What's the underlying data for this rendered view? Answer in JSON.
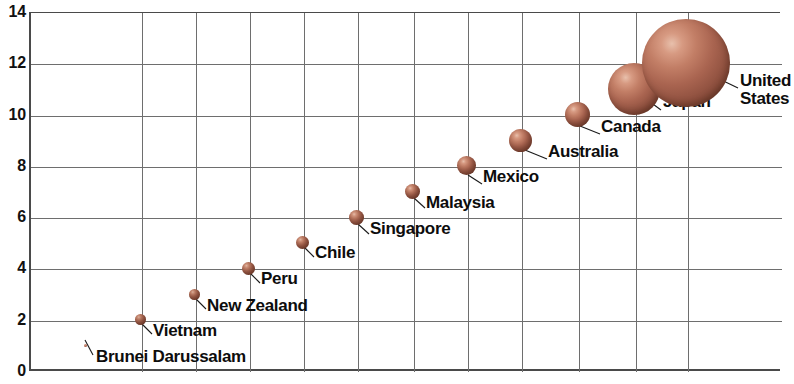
{
  "chart_data": {
    "type": "scatter",
    "title": "",
    "xlabel": "",
    "ylabel": "",
    "ylim": [
      0,
      14
    ],
    "y_ticks": [
      0,
      2,
      4,
      6,
      8,
      10,
      12,
      14
    ],
    "grid": true,
    "legend": "none",
    "marker": "bubble",
    "note": "Bubble chart: each country is a sphere placed in rank order; bubble area grows with value.",
    "categories": [
      "Brunei Darussalam",
      "Vietnam",
      "New Zealand",
      "Peru",
      "Chile",
      "Singapore",
      "Malaysia",
      "Mexico",
      "Australia",
      "Canada",
      "Japan",
      "United States"
    ],
    "values": [
      1,
      2,
      3,
      4,
      5,
      6,
      7,
      8,
      9,
      10,
      11,
      12
    ],
    "points": [
      {
        "label": "Brunei Darussalam",
        "x": 1,
        "y": 1,
        "px": 85,
        "r": 1.5,
        "label_x": 96,
        "label_y": 348,
        "leader": {
          "x1": 85,
          "y1": 340,
          "x2": 93,
          "y2": 355
        },
        "lines": [
          "Brunei Darussalam"
        ]
      },
      {
        "label": "Vietnam",
        "x": 2,
        "y": 2,
        "px": 140,
        "r": 5.5,
        "label_x": 153,
        "label_y": 322,
        "leader": {
          "x1": 142,
          "y1": 324,
          "x2": 152,
          "y2": 334
        },
        "lines": [
          "Vietnam"
        ]
      },
      {
        "label": "New Zealand",
        "x": 3,
        "y": 3,
        "px": 194,
        "r": 5.5,
        "label_x": 207,
        "label_y": 297,
        "leader": {
          "x1": 196,
          "y1": 299,
          "x2": 206,
          "y2": 309
        },
        "lines": [
          "New Zealand"
        ]
      },
      {
        "label": "Peru",
        "x": 4,
        "y": 4,
        "px": 248,
        "r": 6.5,
        "label_x": 261,
        "label_y": 270,
        "leader": {
          "x1": 250,
          "y1": 273,
          "x2": 260,
          "y2": 283
        },
        "lines": [
          "Peru"
        ]
      },
      {
        "label": "Chile",
        "x": 5,
        "y": 5,
        "px": 302,
        "r": 6.5,
        "label_x": 315,
        "label_y": 244,
        "leader": {
          "x1": 304,
          "y1": 247,
          "x2": 314,
          "y2": 257
        },
        "lines": [
          "Chile"
        ]
      },
      {
        "label": "Singapore",
        "x": 6,
        "y": 6,
        "px": 356,
        "r": 7.5,
        "label_x": 370,
        "label_y": 220,
        "leader": {
          "x1": 358,
          "y1": 224,
          "x2": 369,
          "y2": 234
        },
        "lines": [
          "Singapore"
        ]
      },
      {
        "label": "Malaysia",
        "x": 7,
        "y": 7,
        "px": 412,
        "r": 7.5,
        "label_x": 426,
        "label_y": 194,
        "leader": {
          "x1": 414,
          "y1": 198,
          "x2": 425,
          "y2": 208
        },
        "lines": [
          "Malaysia"
        ]
      },
      {
        "label": "Mexico",
        "x": 8,
        "y": 8,
        "px": 466,
        "r": 9.5,
        "label_x": 483,
        "label_y": 168,
        "leader": {
          "x1": 468,
          "y1": 175,
          "x2": 482,
          "y2": 184
        },
        "lines": [
          "Mexico"
        ]
      },
      {
        "label": "Australia",
        "x": 9,
        "y": 9,
        "px": 520,
        "r": 11.5,
        "label_x": 548,
        "label_y": 143,
        "leader": {
          "x1": 525,
          "y1": 150,
          "x2": 547,
          "y2": 159
        },
        "lines": [
          "Australia"
        ]
      },
      {
        "label": "Canada",
        "x": 10,
        "y": 10,
        "px": 577,
        "r": 12.5,
        "label_x": 601,
        "label_y": 118,
        "leader": {
          "x1": 580,
          "y1": 126,
          "x2": 600,
          "y2": 134
        },
        "lines": [
          "Canada"
        ]
      },
      {
        "label": "Japan",
        "x": 11,
        "y": 11,
        "px": 634,
        "r": 26,
        "label_x": 663,
        "label_y": 93,
        "leader": {
          "x1": 630,
          "y1": 87,
          "x2": 661,
          "y2": 110
        },
        "lines": [
          "Japan"
        ]
      },
      {
        "label": "United States",
        "x": 12,
        "y": 12,
        "px": 686,
        "r": 44,
        "label_x": 740,
        "label_y": 72,
        "leader": {
          "x1": 684,
          "y1": 62,
          "x2": 738,
          "y2": 88
        },
        "lines": [
          "United",
          "States"
        ]
      }
    ],
    "colors": {
      "bubble_fill": "#a96450",
      "bubble_highlight": "#e8c0ac",
      "bubble_shadow": "#5e3527",
      "grid": "#6e6e6e",
      "axis": "#4a4a4a",
      "text": "#0d0d0d"
    }
  },
  "axis": {
    "y_tick_labels": [
      "14",
      "12",
      "10",
      "8",
      "6",
      "4",
      "2",
      "0"
    ]
  }
}
